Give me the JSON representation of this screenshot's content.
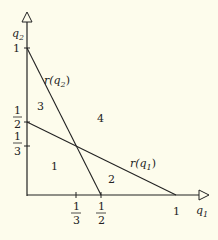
{
  "axes": {
    "x_label": "q",
    "x_sub": "1",
    "y_label": "q",
    "y_sub": "2"
  },
  "ticks": {
    "x": [
      {
        "num": "1",
        "den": "3"
      },
      {
        "num": "1",
        "den": "2"
      },
      {
        "value": "1"
      }
    ],
    "y": [
      {
        "value": "1"
      },
      {
        "num": "1",
        "den": "2"
      },
      {
        "num": "1",
        "den": "3"
      }
    ]
  },
  "lines": {
    "r_q2": {
      "label": "r(q",
      "sub": "2",
      "close": ")"
    },
    "r_q1": {
      "label": "r(q",
      "sub": "1",
      "close": ")"
    }
  },
  "regions": [
    "1",
    "2",
    "3",
    "4"
  ],
  "colors": {
    "background": "#fdfcec",
    "ink": "#222222"
  }
}
